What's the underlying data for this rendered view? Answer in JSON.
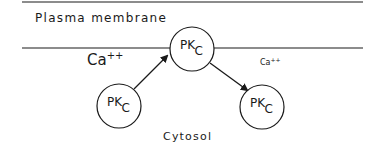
{
  "diagram": {
    "regions": {
      "membrane_label": "Plasma membrane",
      "cytosol_label": "Cytosol"
    },
    "ions": {
      "left": {
        "base": "Ca",
        "charge": "++"
      },
      "right": {
        "base": "Ca",
        "charge": "++"
      }
    },
    "nodes": [
      {
        "id": "pkc-membrane",
        "base": "PK",
        "sub": "C"
      },
      {
        "id": "pkc-cytosol-inactive",
        "base": "PK",
        "sub": "C"
      },
      {
        "id": "pkc-cytosol-released",
        "base": "PK",
        "sub": "C"
      }
    ],
    "edges": [
      {
        "from": "pkc-cytosol-inactive",
        "to": "pkc-membrane"
      },
      {
        "from": "pkc-membrane",
        "to": "pkc-cytosol-released"
      }
    ],
    "colors": {
      "stroke": "#1a1a1a",
      "background": "#ffffff"
    }
  }
}
